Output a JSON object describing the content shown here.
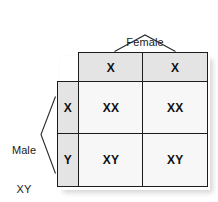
{
  "diagram": {
    "female": {
      "name": "Female",
      "genotype": "XX",
      "gametes": [
        "X",
        "X"
      ]
    },
    "male": {
      "name": "Male",
      "genotype": "XY",
      "gametes": [
        "X",
        "Y"
      ]
    },
    "offspring_rows": [
      {
        "parent_gamete": "X",
        "cells": [
          "XX",
          "XX"
        ]
      },
      {
        "parent_gamete": "Y",
        "cells": [
          "XY",
          "XY"
        ]
      }
    ],
    "colors": {
      "gamete_header_fill": "#e4e4e4",
      "offspring_cell_fill": "#f7f7f7",
      "border": "#1c1c1c",
      "text": "#111111",
      "background": "#ffffff"
    }
  }
}
